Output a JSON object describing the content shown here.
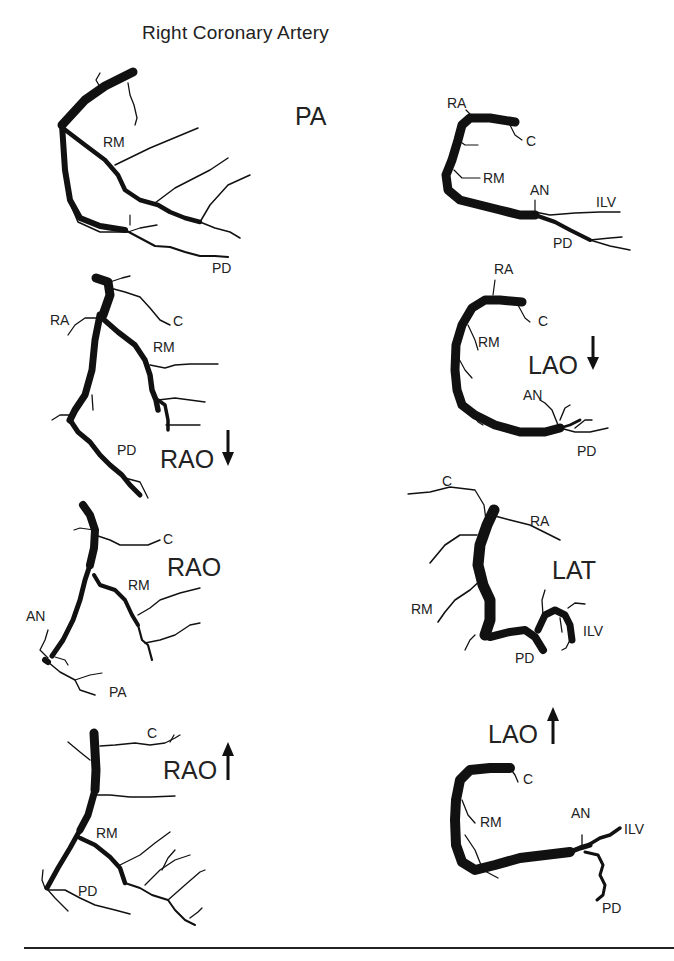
{
  "title": "Right Coronary Artery",
  "panels": [
    {
      "id": "pa",
      "view_label": "PA",
      "arrow": null,
      "labels": [
        "RM",
        "PD"
      ]
    },
    {
      "id": "lao-cranial-top",
      "view_label": "",
      "arrow": null,
      "labels": [
        "RA",
        "C",
        "RM",
        "AN",
        "ILV",
        "PD"
      ]
    },
    {
      "id": "rao-caudal",
      "view_label": "RAO",
      "arrow": "down",
      "labels": [
        "RA",
        "C",
        "RM",
        "PD"
      ]
    },
    {
      "id": "lao-caudal",
      "view_label": "LAO",
      "arrow": "down",
      "labels": [
        "RA",
        "C",
        "RM",
        "AN",
        "PD"
      ]
    },
    {
      "id": "rao",
      "view_label": "RAO",
      "arrow": null,
      "labels": [
        "C",
        "RM",
        "AN",
        "PA"
      ]
    },
    {
      "id": "lat",
      "view_label": "LAT",
      "arrow": null,
      "labels": [
        "C",
        "RA",
        "RM",
        "ILV",
        "PD"
      ]
    },
    {
      "id": "rao-cranial",
      "view_label": "RAO",
      "arrow": "up",
      "labels": [
        "C",
        "RM",
        "PD"
      ]
    },
    {
      "id": "lao-cranial",
      "view_label": "LAO",
      "arrow": "up",
      "labels": [
        "C",
        "RM",
        "AN",
        "ILV",
        "PD"
      ]
    }
  ],
  "text": {
    "pa_view": "PA",
    "pa_rm": "RM",
    "pa_pd": "PD",
    "tr_ra": "RA",
    "tr_c": "C",
    "tr_rm": "RM",
    "tr_an": "AN",
    "tr_ilv": "ILV",
    "tr_pd": "PD",
    "raoc_view": "RAO",
    "raoc_ra": "RA",
    "raoc_c": "C",
    "raoc_rm": "RM",
    "raoc_pd": "PD",
    "laoc_view": "LAO",
    "laoc_ra": "RA",
    "laoc_c": "C",
    "laoc_rm": "RM",
    "laoc_an": "AN",
    "laoc_pd": "PD",
    "rao_view": "RAO",
    "rao_c": "C",
    "rao_rm": "RM",
    "rao_an": "AN",
    "rao_pa": "PA",
    "lat_view": "LAT",
    "lat_c": "C",
    "lat_ra": "RA",
    "lat_rm": "RM",
    "lat_ilv": "ILV",
    "lat_pd": "PD",
    "raocr_view": "RAO",
    "raocr_c": "C",
    "raocr_rm": "RM",
    "raocr_pd": "PD",
    "laocr_view": "LAO",
    "laocr_c": "C",
    "laocr_rm": "RM",
    "laocr_an": "AN",
    "laocr_ilv": "ILV",
    "laocr_pd": "PD"
  },
  "colors": {
    "ink": "#111111",
    "background": "#ffffff"
  }
}
